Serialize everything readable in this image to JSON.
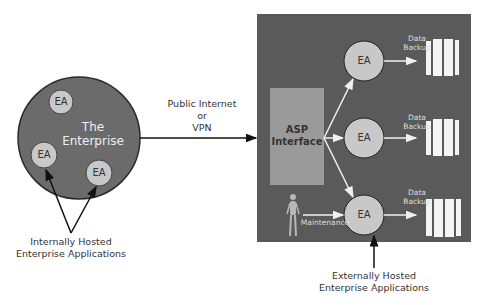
{
  "diagram": {
    "colors": {
      "background": "#ffffff",
      "panel": "#5a5a5a",
      "enterprise_circle": "#6b6b6b",
      "ea_circle": "#c8c8c8",
      "asp_box": "#9a9a9a",
      "storage": "#f4f4f4",
      "arrow_dark": "#111111",
      "arrow_light": "#f0f0f0"
    },
    "enterprise": {
      "title_line1": "The",
      "title_line2": "Enterprise",
      "ea_nodes": [
        {
          "label": "EA"
        },
        {
          "label": "EA"
        },
        {
          "label": "EA"
        }
      ]
    },
    "internal_caption": {
      "line1": "Internally Hosted",
      "line2": "Enterprise Applications"
    },
    "connection": {
      "line1": "Public Internet",
      "line2": "or",
      "line3": "VPN"
    },
    "asp": {
      "line1": "ASP",
      "line2": "Interface"
    },
    "external_nodes": [
      {
        "label": "EA",
        "backup_line1": "Data",
        "backup_line2": "Backup"
      },
      {
        "label": "EA",
        "backup_line1": "Data",
        "backup_line2": "Backup"
      },
      {
        "label": "EA",
        "backup_line1": "Data",
        "backup_line2": "Backup"
      }
    ],
    "maintenance": {
      "label": "Maintenance",
      "icon": "person-icon"
    },
    "external_caption": {
      "line1": "Externally Hosted",
      "line2": "Enterprise Applications"
    }
  }
}
